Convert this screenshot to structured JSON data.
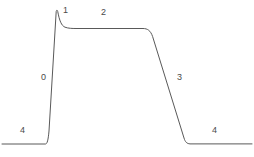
{
  "figure": {
    "width": 254,
    "height": 157,
    "background_color": "#ffffff",
    "line_color": "#595959",
    "line_width": 1,
    "label_color": "#4a4a4a",
    "label_font_size": 9
  },
  "labels": [
    {
      "id": "label-4-left",
      "text": "4",
      "x": 20,
      "y": 126
    },
    {
      "id": "label-0",
      "text": "0",
      "x": 41,
      "y": 73
    },
    {
      "id": "label-1",
      "text": "1",
      "x": 63,
      "y": 6
    },
    {
      "id": "label-2",
      "text": "2",
      "x": 101,
      "y": 8
    },
    {
      "id": "label-3",
      "text": "3",
      "x": 177,
      "y": 73
    },
    {
      "id": "label-4-right",
      "text": "4",
      "x": 212,
      "y": 126
    }
  ],
  "chart_data": {
    "type": "line",
    "title": "",
    "subtitle": "",
    "xlabel": "",
    "ylabel": "",
    "grid": false,
    "legend": "none",
    "axes_visible": false,
    "xlim": [
      0,
      254
    ],
    "ylim": [
      157,
      0
    ],
    "annotations": [
      {
        "text": "4",
        "x": 22,
        "y": 131,
        "segment": "left baseline"
      },
      {
        "text": "0",
        "x": 44,
        "y": 78,
        "segment": "rising edge"
      },
      {
        "text": "1",
        "x": 66,
        "y": 11,
        "segment": "peak / overshoot"
      },
      {
        "text": "2",
        "x": 104,
        "y": 13,
        "segment": "upper plateau"
      },
      {
        "text": "3",
        "x": 180,
        "y": 78,
        "segment": "falling edge"
      },
      {
        "text": "4",
        "x": 215,
        "y": 131,
        "segment": "right baseline"
      }
    ],
    "series": [
      {
        "name": "waveform",
        "color": "#595959",
        "path": "M 2 144 L 45.5 144 C 47.2 144 48.2 140 49 131 L 56.2 11.5 C 56.6 9.6 57.4 9.8 57.8 11.8 C 59.4 20.5 61.5 25.8 65 27.2 C 68.5 28.4 72 28.5 76 28.5 L 143 28.5 C 147.5 28.5 150.5 30.5 152.6 36.5 L 184 138 C 185.2 142 186.8 143.6 190 143.9 L 252 143.9",
        "points": [
          {
            "x": 2,
            "y": 144
          },
          {
            "x": 45,
            "y": 144
          },
          {
            "x": 49,
            "y": 131
          },
          {
            "x": 57,
            "y": 10
          },
          {
            "x": 62,
            "y": 23
          },
          {
            "x": 70,
            "y": 28
          },
          {
            "x": 100,
            "y": 28
          },
          {
            "x": 143,
            "y": 28
          },
          {
            "x": 150,
            "y": 32
          },
          {
            "x": 155,
            "y": 42
          },
          {
            "x": 170,
            "y": 90
          },
          {
            "x": 184,
            "y": 138
          },
          {
            "x": 190,
            "y": 144
          },
          {
            "x": 220,
            "y": 144
          },
          {
            "x": 252,
            "y": 144
          }
        ]
      }
    ]
  }
}
